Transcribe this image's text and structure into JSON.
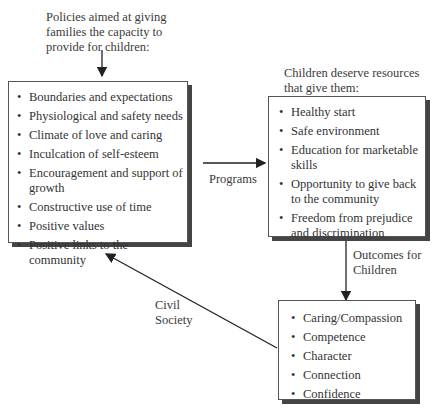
{
  "top_label": "Policies aimed at giving families the capacity to provide for children:",
  "left_box": {
    "items": [
      "Boundaries and expectations",
      "Physiological and safety needs",
      "Climate of love and caring",
      "Inculcation of self-esteem",
      "Encouragement and support of growth",
      "Constructive use of time",
      "Positive values",
      "Positive links to the community"
    ]
  },
  "right_label": "Children deserve resources that give them:",
  "right_box": {
    "items": [
      "Healthy start",
      "Safe environment",
      "Education for marketable skills",
      "Opportunity to give back to the community",
      "Freedom from prejudice and discrimination"
    ]
  },
  "programs_label": "Programs",
  "outcomes_label": "Outcomes for Children",
  "bottom_box": {
    "items": [
      "Caring/Compassion",
      "Competence",
      "Character",
      "Connection",
      "Confidence"
    ]
  },
  "civil_society_label": "Civil Society"
}
